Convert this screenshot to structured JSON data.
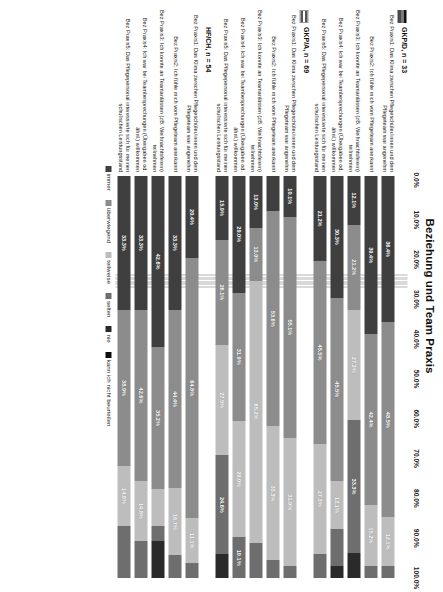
{
  "chart_data": {
    "type": "bar",
    "title": "Beziehung und Team Praxis",
    "subtype": "stacked-horizontal-100",
    "xlabel": "",
    "ylabel": "",
    "xlim": [
      0,
      100
    ],
    "grid": true,
    "legend_position": "bottom",
    "tick_labels": [
      "0.0%",
      "10.0%",
      "20.0%",
      "30.0%",
      "40.0%",
      "50.0%",
      "60.0%",
      "70.0%",
      "80.0%",
      "90.0%",
      "100.0%"
    ],
    "series": [
      {
        "name": "immer",
        "color": "#3f3f3f"
      },
      {
        "name": "überwiegend",
        "color": "#8c8c8c"
      },
      {
        "name": "teilweise",
        "color": "#bdbdbd"
      },
      {
        "name": "selten",
        "color": "#6e6e6e"
      },
      {
        "name": "nie",
        "color": "#2a2a2a"
      },
      {
        "name": "kann ich nicht beurteilen",
        "color": "#0d0d0d"
      }
    ],
    "groups": [
      {
        "label": "GKP/D, n = 33",
        "marker": "flag-de",
        "categories": [
          {
            "label": "Bez Praxis1: Das Klima zwischen Pflegeschüler/innen und dem Pflegeteam war angenehm",
            "values": [
              36.4,
              48.5,
              12.1,
              3.0,
              0.0,
              0.0
            ],
            "labels": [
              "36.4%",
              "48.5%",
              "12.1%",
              "",
              "",
              ""
            ]
          },
          {
            "label": "Bez Praxis2: Ich fühle mich vom Pflegeteam anerkannt",
            "values": [
              39.4,
              42.4,
              15.2,
              3.0,
              0.0,
              0.0
            ],
            "labels": [
              "39.4%",
              "42.4%",
              "15.2%",
              "",
              "",
              ""
            ]
          },
          {
            "label": "Bez Praxis3: Ich konnte an Teamanlässen (zB. Weihnachtsfeiern) teilnehmen",
            "values": [
              12.1,
              21.2,
              27.3,
              33.3,
              6.1,
              0.0
            ],
            "labels": [
              "12.1%",
              "21.2%",
              "27.3%",
              "33.3%",
              "",
              ""
            ]
          },
          {
            "label": "Bez Praxis4: Ich war bei Teambesprechungen (Übergaben od. ähnl.) willkommen",
            "values": [
              30.3,
              45.5,
              12.1,
              9.1,
              3.0,
              0.0
            ],
            "labels": [
              "30.3%",
              "45.5%",
              "12.1%",
              "",
              "",
              ""
            ]
          },
          {
            "label": "Bez Praxis5: Das Pflegepersonal interessierte sich für meinen schulischen Leistungsstand",
            "values": [
              21.2,
              45.5,
              27.3,
              6.1,
              0.0,
              0.0
            ],
            "labels": [
              "21.2%",
              "45.5%",
              "27.3%",
              "",
              "",
              ""
            ]
          }
        ]
      },
      {
        "label": "GKP/A, n = 69",
        "marker": "flag-at",
        "categories": [
          {
            "label": "Bez Praxis1: Das Klima zwischen Pflegeschüler/innen und dem Pflegeteam war angenehm",
            "values": [
              10.1,
              55.1,
              31.9,
              2.9,
              0.0,
              0.0
            ],
            "labels": [
              "10.1%",
              "55.1%",
              "31.9%",
              "",
              "",
              ""
            ]
          },
          {
            "label": "Bez Praxis2: Ich fühle mich vom Pflegeteam anerkannt",
            "values": [
              8.7,
              53.6,
              33.3,
              4.4,
              0.0,
              0.0
            ],
            "labels": [
              "",
              "53.6%",
              "33.3%",
              "",
              "",
              ""
            ]
          },
          {
            "label": "Bez Praxis3: Ich konnte an Teamanlässen (zB. Weihnachtsfeiern) teilnehmen",
            "values": [
              13.0,
              13.0,
              65.2,
              8.8,
              0.0,
              0.0
            ],
            "labels": [
              "13.0%",
              "13.0%",
              "65.2%",
              "",
              "",
              ""
            ]
          },
          {
            "label": "Bez Praxis4: Ich war bei Teambesprechungen (Übergaben od. ähnl.) willkommen",
            "values": [
              29.0,
              31.9,
              29.0,
              10.1,
              0.0,
              0.0
            ],
            "labels": [
              "29.0%",
              "31.9%",
              "29.0%",
              "10.1%",
              "",
              ""
            ]
          },
          {
            "label": "Bez Praxis5: Das Pflegepersonal interessierte sich für meinen schulischen Leistungsstand",
            "values": [
              15.9,
              26.1,
              27.5,
              24.6,
              5.9,
              0.0
            ],
            "labels": [
              "15.9%",
              "26.1%",
              "27.5%",
              "24.6%",
              "",
              ""
            ]
          }
        ]
      },
      {
        "label": "HF/CH, n = 54",
        "marker": "flag-ch",
        "categories": [
          {
            "label": "Bez Praxis1: Das Klima zwischen Pflegeschüler/innen und dem Pflegeteam war angenehm",
            "values": [
              20.4,
              64.8,
              11.1,
              3.7,
              0.0,
              0.0
            ],
            "labels": [
              "20.4%",
              "64.8%",
              "11.1%",
              "",
              "",
              ""
            ]
          },
          {
            "label": "Bez Praxis2: Ich fühle mich vom Pflegeteam anerkannt",
            "values": [
              33.3,
              44.4,
              16.7,
              5.6,
              0.0,
              0.0
            ],
            "labels": [
              "33.3%",
              "44.4%",
              "16.7%",
              "",
              "",
              ""
            ]
          },
          {
            "label": "Bez Praxis3: Ich konnte an Teamanlässen (zB. Weihnachtsfeiern) teilnehmen",
            "values": [
              42.6,
              35.2,
              9.3,
              3.7,
              9.2,
              0.0
            ],
            "labels": [
              "42.6%",
              "35.2%",
              "",
              "",
              "",
              ""
            ]
          },
          {
            "label": "Bez Praxis4: Ich war bei Teambesprechungen (Übergaben od. ähnl.) willkommen",
            "values": [
              33.3,
              42.6,
              14.8,
              9.3,
              0.0,
              0.0
            ],
            "labels": [
              "33.3%",
              "42.6%",
              "14.8%",
              "",
              "",
              ""
            ]
          },
          {
            "label": "Bez Praxis5: Das Pflegepersonal interessierte sich für meinen schulischen Leistungsstand",
            "values": [
              33.3,
              38.9,
              14.8,
              13.0,
              0.0,
              0.0
            ],
            "labels": [
              "33.3%",
              "38.9%",
              "14.8%",
              "",
              "",
              ""
            ]
          }
        ]
      }
    ]
  }
}
